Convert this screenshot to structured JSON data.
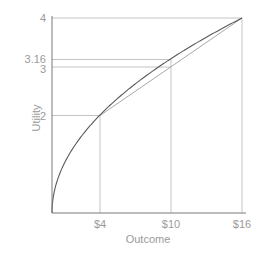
{
  "chart_data": {
    "type": "line",
    "title": "",
    "xlabel": "Outcome",
    "ylabel": "Utility",
    "xlim": [
      0,
      16
    ],
    "ylim": [
      0,
      4
    ],
    "grid": false,
    "legend": null,
    "x_ticks": [
      {
        "value": 4,
        "label": "$4"
      },
      {
        "value": 10,
        "label": "$10"
      },
      {
        "value": 16,
        "label": "$16"
      }
    ],
    "y_ticks": [
      {
        "value": 2,
        "label": "2"
      },
      {
        "value": 3,
        "label": "3"
      },
      {
        "value": 3.16,
        "label": "3.16"
      },
      {
        "value": 4,
        "label": "4"
      }
    ],
    "series": [
      {
        "name": "Utility curve (U = sqrt(x))",
        "kind": "curve",
        "x": [
          0,
          0.25,
          1,
          2,
          4,
          6,
          8,
          10,
          12,
          14,
          16
        ],
        "values": [
          0,
          0.5,
          1,
          1.41,
          2,
          2.45,
          2.83,
          3.16,
          3.46,
          3.74,
          4
        ],
        "color": "#555555"
      },
      {
        "name": "Chord between $4 and $16",
        "kind": "line",
        "x": [
          4,
          16
        ],
        "values": [
          2,
          4
        ],
        "color": "#aaaaaa"
      }
    ],
    "reference_lines": [
      {
        "orientation": "vertical",
        "x": 4,
        "from_y": 0,
        "to_y": 2
      },
      {
        "orientation": "vertical",
        "x": 10,
        "from_y": 0,
        "to_y": 3.16
      },
      {
        "orientation": "vertical",
        "x": 16,
        "from_y": 0,
        "to_y": 4
      },
      {
        "orientation": "horizontal",
        "y": 2,
        "from_x": 0,
        "to_x": 4
      },
      {
        "orientation": "horizontal",
        "y": 3,
        "from_x": 0,
        "to_x": 10
      },
      {
        "orientation": "horizontal",
        "y": 3.16,
        "from_x": 0,
        "to_x": 10
      },
      {
        "orientation": "horizontal",
        "y": 4,
        "from_x": 0,
        "to_x": 16
      }
    ]
  },
  "labels": {
    "xlabel": "Outcome",
    "ylabel": "Utility",
    "x_ticks": [
      "$4",
      "$10",
      "$16"
    ],
    "y_ticks": [
      "4",
      "3.16",
      "3",
      "2"
    ]
  }
}
